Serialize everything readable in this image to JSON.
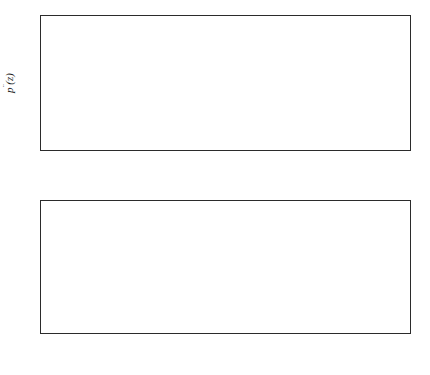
{
  "figure": {
    "background": "#ffffff",
    "line_color": "#111111",
    "axis_color": "#2b2b2b"
  },
  "chart_data": [
    {
      "type": "line",
      "panel": "top",
      "title": "",
      "xlabel": "z",
      "ylabel": "pˮ(z)",
      "ylabel_display": "p̈(z)",
      "xlim": [
        -4,
        3
      ],
      "ylim": [
        -0.5,
        0
      ],
      "xticks": [
        -4,
        -3,
        -2,
        -1,
        0,
        1,
        2,
        3
      ],
      "xticklabels": [
        "−4",
        "−3",
        "−2",
        "−1",
        "0",
        "1",
        "2",
        "3"
      ],
      "yticks": [
        -0.5,
        -0.4,
        -0.3,
        -0.2,
        -0.1,
        0
      ],
      "yticklabels": [
        "−0.5",
        "−0.4",
        "−0.3",
        "−0.2",
        "−0.1",
        "0"
      ],
      "grid": false,
      "legend": "none",
      "x": [
        -3.6,
        -3.4,
        -3.2,
        -3.0,
        -2.8,
        -2.6,
        -2.4,
        -2.2,
        -2.0,
        -1.8,
        -1.6,
        -1.4,
        -1.2,
        -1.0,
        -0.8,
        -0.6,
        -0.4,
        -0.2,
        0.0,
        0.2,
        0.4,
        0.6,
        0.8,
        1.0,
        1.2,
        1.4,
        1.6,
        1.8,
        2.0,
        2.2,
        2.4,
        2.6,
        2.8,
        3.0
      ],
      "series": [
        {
          "name": "λ = 0.5",
          "style": "dotted",
          "values": [
            -0.335,
            -0.335,
            -0.335,
            -0.335,
            -0.336,
            -0.336,
            -0.336,
            -0.336,
            -0.337,
            -0.337,
            -0.337,
            -0.337,
            -0.337,
            -0.337,
            -0.337,
            -0.337,
            -0.337,
            -0.336,
            -0.336,
            -0.336,
            -0.336,
            -0.336,
            -0.336,
            -0.336,
            -0.336,
            -0.336,
            -0.336,
            -0.336,
            -0.336,
            -0.337,
            -0.337,
            -0.337,
            -0.337,
            -0.337
          ]
        },
        {
          "name": "λ = 0.9",
          "style": "dashed",
          "values": [
            -0.312,
            -0.314,
            -0.316,
            -0.318,
            -0.32,
            -0.323,
            -0.326,
            -0.329,
            -0.332,
            -0.335,
            -0.338,
            -0.341,
            -0.344,
            -0.347,
            -0.35,
            -0.352,
            -0.353,
            -0.35,
            -0.341,
            -0.326,
            -0.308,
            -0.29,
            -0.275,
            -0.263,
            -0.256,
            -0.255,
            -0.26,
            -0.27,
            -0.285,
            -0.301,
            -0.317,
            -0.33,
            -0.338,
            -0.341
          ]
        },
        {
          "name": "λ = 1.0",
          "style": "solid",
          "values": [
            -0.334,
            -0.336,
            -0.339,
            -0.343,
            -0.35,
            -0.36,
            -0.374,
            -0.392,
            -0.412,
            -0.433,
            -0.452,
            -0.465,
            -0.471,
            -0.47,
            -0.455,
            -0.415,
            -0.347,
            -0.259,
            -0.168,
            -0.095,
            -0.047,
            -0.023,
            -0.017,
            -0.021,
            -0.035,
            -0.06,
            -0.097,
            -0.143,
            -0.197,
            -0.252,
            -0.3,
            -0.331,
            -0.346,
            -0.351
          ]
        }
      ],
      "annotations": {
        "solid_peak": {
          "x": 0.85,
          "y": -0.017
        },
        "solid_trough": {
          "x": -1.05,
          "y": -0.471
        },
        "dashed_peak": {
          "x": 0.95,
          "y": -0.255
        }
      }
    },
    {
      "type": "line",
      "panel": "bottom",
      "title": "",
      "xlabel": "z",
      "ylabel": "Density of z",
      "xlim": [
        -4,
        3
      ],
      "ylim": [
        0,
        0.8
      ],
      "xticks": [
        -4,
        -3,
        -2,
        -1,
        0,
        1,
        2,
        3
      ],
      "xticklabels": [
        "−4",
        "−3",
        "−2",
        "−1",
        "0",
        "1",
        "2",
        "3"
      ],
      "yticks": [
        0,
        0.2,
        0.4,
        0.6,
        0.8
      ],
      "yticklabels": [
        "0",
        "0.2",
        "0.4",
        "0.6",
        "0.8"
      ],
      "grid": false,
      "legend": "upper right",
      "x": [
        -3.0,
        -2.8,
        -2.6,
        -2.4,
        -2.2,
        -2.0,
        -1.8,
        -1.6,
        -1.4,
        -1.2,
        -1.0,
        -0.8,
        -0.6,
        -0.4,
        -0.2,
        0.0,
        0.2,
        0.4,
        0.6,
        0.8,
        1.0,
        1.2,
        1.4,
        1.6,
        1.8,
        2.0,
        2.2,
        2.4
      ],
      "series": [
        {
          "name": "λ = 0.5",
          "style": "dotted",
          "values": [
            0.004,
            0.01,
            0.021,
            0.038,
            0.063,
            0.097,
            0.14,
            0.191,
            0.247,
            0.305,
            0.36,
            0.409,
            0.449,
            0.476,
            0.489,
            0.487,
            0.47,
            0.44,
            0.399,
            0.351,
            0.299,
            0.246,
            0.196,
            0.151,
            0.112,
            0.08,
            0.054,
            0.031
          ]
        },
        {
          "name": "λ = 0.9",
          "style": "dashed",
          "values": [
            0.004,
            0.01,
            0.021,
            0.038,
            0.063,
            0.097,
            0.14,
            0.191,
            0.248,
            0.307,
            0.363,
            0.413,
            0.453,
            0.48,
            0.492,
            0.489,
            0.471,
            0.441,
            0.4,
            0.352,
            0.3,
            0.248,
            0.198,
            0.153,
            0.114,
            0.082,
            0.055,
            0.031
          ]
        },
        {
          "name": "λ = 1.0",
          "style": "solid",
          "values": [
            0.002,
            0.005,
            0.011,
            0.021,
            0.037,
            0.061,
            0.094,
            0.137,
            0.189,
            0.25,
            0.314,
            0.376,
            0.432,
            0.477,
            0.506,
            0.516,
            0.506,
            0.478,
            0.434,
            0.38,
            0.321,
            0.262,
            0.207,
            0.158,
            0.117,
            0.083,
            0.056,
            0.032
          ]
        }
      ],
      "annotations": {
        "solid_peak": {
          "x": 0.0,
          "y": 0.517
        },
        "dotted_peak": {
          "x": -0.25,
          "y": 0.49
        },
        "dashed_peak": {
          "x": -0.25,
          "y": 0.492
        }
      },
      "legend_entries": [
        {
          "label": "λ = 0.5",
          "lambda": "λ",
          "rest": " = 0.5",
          "style": "dotted"
        },
        {
          "label": "λ = 0.9",
          "lambda": "λ",
          "rest": " = 0.9",
          "style": "dashed"
        },
        {
          "label": "λ = 1.0",
          "lambda": "λ",
          "rest": " = 1.0",
          "style": "solid"
        }
      ]
    }
  ]
}
